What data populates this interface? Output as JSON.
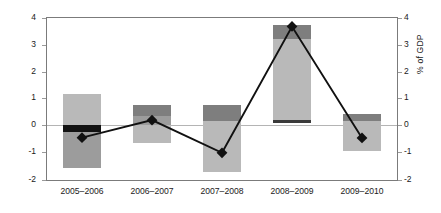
{
  "chart_data": {
    "type": "bar",
    "title": "",
    "subtitle": "",
    "xlabel": "",
    "ylabel": "% of GDP",
    "ylabel_right": "% of GDP",
    "ylim": [
      -2,
      4
    ],
    "ytick_labels": [
      "4",
      "3",
      "2",
      "1",
      "0",
      "-1",
      "-2"
    ],
    "ytick_values": [
      4,
      3,
      2,
      1,
      0,
      -1,
      -2
    ],
    "ytick_labels_right": [
      "4",
      "3",
      "2",
      "1",
      "0",
      "-1",
      "-2"
    ],
    "grid": false,
    "legend": "none",
    "categories": [
      "2005–2006",
      "2006–2007",
      "2007–2008",
      "2008–2009",
      "2009–2010"
    ],
    "bars": [
      {
        "category": "2005–2006",
        "segments": [
          {
            "name": "light",
            "top": 1.15,
            "bottom": 0.0,
            "color": "#b9b9b9"
          },
          {
            "name": "black",
            "top": 0.0,
            "bottom": -0.25,
            "color": "#121212"
          },
          {
            "name": "mid",
            "top": -0.25,
            "bottom": -1.6,
            "color": "#9c9c9c"
          }
        ]
      },
      {
        "category": "2006–2007",
        "segments": [
          {
            "name": "dark",
            "top": 0.75,
            "bottom": 0.32,
            "color": "#7e7e7e"
          },
          {
            "name": "mid",
            "top": 0.32,
            "bottom": 0.0,
            "color": "#9c9c9c"
          },
          {
            "name": "light",
            "top": 0.0,
            "bottom": -0.65,
            "color": "#b9b9b9"
          }
        ]
      },
      {
        "category": "2007–2008",
        "segments": [
          {
            "name": "dark",
            "top": 0.75,
            "bottom": 0.15,
            "color": "#7e7e7e"
          },
          {
            "name": "light",
            "top": 0.15,
            "bottom": -1.75,
            "color": "#b9b9b9"
          }
        ]
      },
      {
        "category": "2008–2009",
        "segments": [
          {
            "name": "dark",
            "top": 3.72,
            "bottom": 3.2,
            "color": "#7e7e7e"
          },
          {
            "name": "light",
            "top": 3.2,
            "bottom": 0.18,
            "color": "#b9b9b9"
          },
          {
            "name": "black",
            "top": 0.18,
            "bottom": 0.06,
            "color": "#3a3a3a"
          }
        ]
      },
      {
        "category": "2009–2010",
        "segments": [
          {
            "name": "dark",
            "top": 0.42,
            "bottom": 0.15,
            "color": "#7e7e7e"
          },
          {
            "name": "light",
            "top": 0.15,
            "bottom": -0.95,
            "color": "#b9b9b9"
          }
        ]
      }
    ],
    "series": [
      {
        "name": "net balance",
        "type": "line",
        "marker": "diamond",
        "color": "#111111",
        "values": [
          -0.47,
          0.18,
          -1.03,
          3.65,
          -0.48
        ]
      }
    ]
  }
}
